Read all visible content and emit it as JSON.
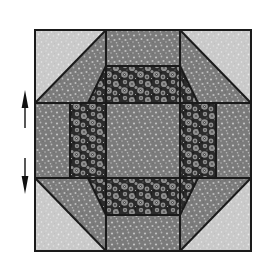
{
  "figure": {
    "background_color": "#ffffff"
  },
  "fabrics": [
    {
      "id": "light",
      "name": "light-speckled-fabric",
      "base_color": "#c9c9c9",
      "speck_color": "#e8e8e8",
      "description": "light gray finely speckled background fabric"
    },
    {
      "id": "medium",
      "name": "medium-gray-speckled-fabric",
      "base_color": "#7b7b7b",
      "speck_color": "#c2c2c2",
      "description": "medium gray fabric with small light dots"
    },
    {
      "id": "dark",
      "name": "dark-floral-fabric",
      "base_color": "#2f2f2f",
      "speck_color": "#9a9a9a",
      "description": "dark fabric with large light floral motifs"
    }
  ],
  "block": {
    "name": "quilt-block",
    "outline_color": "#1a1a1a",
    "outline_width": 2,
    "seam_color": "#1a1a1a",
    "seam_width": 2,
    "bounds": {
      "x": 35,
      "y": 30,
      "width": 216,
      "height": 221
    },
    "grid": {
      "columns": [
        35,
        106,
        180,
        251
      ],
      "rows": [
        30,
        103,
        178,
        251
      ]
    },
    "patches": [
      {
        "name": "patch-corner-top-left-light",
        "fabric": "light",
        "shape": "triangle",
        "points": "35,30 106,30 35,103"
      },
      {
        "name": "patch-corner-top-left-medium",
        "fabric": "medium",
        "shape": "triangle",
        "points": "106,30 106,103 35,103"
      },
      {
        "name": "patch-top-center-medium",
        "fabric": "medium",
        "shape": "rect",
        "points": "106,30 180,30 180,103 106,103"
      },
      {
        "name": "patch-corner-top-right-light",
        "fabric": "light",
        "shape": "triangle",
        "points": "180,30 251,30 251,103"
      },
      {
        "name": "patch-corner-top-right-medium",
        "fabric": "medium",
        "shape": "triangle",
        "points": "180,30 180,103 251,103"
      },
      {
        "name": "patch-middle-left-medium",
        "fabric": "medium",
        "shape": "rect",
        "points": "35,103 106,103 106,178 35,178"
      },
      {
        "name": "patch-center-medium",
        "fabric": "medium",
        "shape": "rect",
        "points": "106,103 180,103 180,178 106,178"
      },
      {
        "name": "patch-middle-right-medium",
        "fabric": "medium",
        "shape": "rect",
        "points": "180,103 251,103 251,178 180,178"
      },
      {
        "name": "patch-corner-bottom-left-medium",
        "fabric": "medium",
        "shape": "triangle",
        "points": "35,178 106,178 106,251"
      },
      {
        "name": "patch-corner-bottom-left-light",
        "fabric": "light",
        "shape": "triangle",
        "points": "35,178 106,251 35,251"
      },
      {
        "name": "patch-bottom-center-medium",
        "fabric": "medium",
        "shape": "rect",
        "points": "106,178 180,178 180,251 106,251"
      },
      {
        "name": "patch-corner-bottom-right-medium",
        "fabric": "medium",
        "shape": "triangle",
        "points": "180,178 251,178 180,251"
      },
      {
        "name": "patch-corner-bottom-right-light",
        "fabric": "light",
        "shape": "triangle",
        "points": "251,178 251,251 180,251"
      },
      {
        "name": "patch-ring-top-dark",
        "fabric": "dark",
        "shape": "trapezoid",
        "points": "106,66 180,66 198,103 88,103"
      },
      {
        "name": "patch-ring-left-dark",
        "fabric": "dark",
        "shape": "rect",
        "points": "70,103 106,103 106,178 70,178"
      },
      {
        "name": "patch-ring-right-dark",
        "fabric": "dark",
        "shape": "rect",
        "points": "180,103 216,103 216,178 180,178"
      },
      {
        "name": "patch-ring-bottom-dark",
        "fabric": "dark",
        "shape": "trapezoid",
        "points": "88,178 198,178 180,215 106,215"
      }
    ],
    "seams": [
      {
        "name": "seam-vertical-left",
        "points": "106,30 106,251"
      },
      {
        "name": "seam-vertical-right",
        "points": "180,30 180,251"
      },
      {
        "name": "seam-horizontal-top",
        "points": "35,103 251,103"
      },
      {
        "name": "seam-horizontal-bottom",
        "points": "35,178 251,178"
      },
      {
        "name": "seam-diagonal-top-left",
        "points": "35,103 106,30"
      },
      {
        "name": "seam-diagonal-top-right",
        "points": "180,30 251,103"
      },
      {
        "name": "seam-diagonal-bottom-left",
        "points": "35,178 106,251"
      },
      {
        "name": "seam-diagonal-bottom-right",
        "points": "180,251 251,178"
      },
      {
        "name": "seam-octagon-top-left",
        "points": "88,103 106,66"
      },
      {
        "name": "seam-octagon-top-right",
        "points": "180,66 198,103"
      },
      {
        "name": "seam-octagon-bottom-left",
        "points": "88,178 106,215"
      },
      {
        "name": "seam-octagon-bottom-right",
        "points": "180,215 198,178"
      },
      {
        "name": "seam-octagon-inner-top",
        "points": "106,66 180,66"
      },
      {
        "name": "seam-octagon-inner-bottom",
        "points": "106,215 180,215"
      },
      {
        "name": "seam-ring-left-inner",
        "points": "70,103 70,178"
      },
      {
        "name": "seam-ring-right-inner",
        "points": "216,103 216,178"
      }
    ]
  },
  "annotations": {
    "arrows": [
      {
        "name": "grainline-arrow-up",
        "direction": "up",
        "color": "#111111",
        "x": 25,
        "tail_y": 128,
        "head_y": 92,
        "head_width": 7,
        "head_length": 16
      },
      {
        "name": "grainline-arrow-down",
        "direction": "down",
        "color": "#111111",
        "x": 25,
        "tail_y": 158,
        "head_y": 192,
        "head_width": 7,
        "head_length": 16
      }
    ]
  }
}
